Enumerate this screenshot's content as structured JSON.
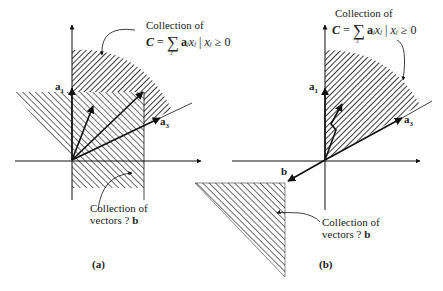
{
  "figure": {
    "panels": [
      {
        "id": "a",
        "caption": "(a)",
        "top_label_line1": "Collection of",
        "formula": {
          "lhs": "C",
          "eq": "=",
          "sum": "∑",
          "sum_index": "j",
          "term": "a",
          "term_sub": "j",
          "var": "x",
          "var_sub": "j",
          "sep": " | ",
          "cond_var": "x",
          "cond_sub": "j",
          "cond": " ≥ 0"
        },
        "bottom_label_line1": "Collection of",
        "bottom_label_line2": "vectors ? ",
        "bottom_label_bold": "b",
        "vectors": {
          "a1": "a",
          "a1_sub": "1",
          "a2": "a",
          "a2_sub": "2",
          "a3": "a",
          "a3_sub": "3",
          "b": "b"
        }
      },
      {
        "id": "b",
        "caption": "(b)",
        "top_label_line1": "Collection of",
        "formula": {
          "lhs": "C",
          "eq": "=",
          "sum": "∑",
          "sum_index": "j",
          "term": "a",
          "term_sub": "j",
          "var": "x",
          "var_sub": "j",
          "sep": " | ",
          "cond_var": "x",
          "cond_sub": "j",
          "cond": " ≥ 0"
        },
        "bottom_label_line1": "Collection of",
        "bottom_label_line2": "vectors ? ",
        "bottom_label_bold": "b",
        "vectors": {
          "a1": "a",
          "a1_sub": "1",
          "a2": "a",
          "a2_sub": "2",
          "a3": "a",
          "a3_sub": "3",
          "b": "b"
        }
      }
    ]
  }
}
